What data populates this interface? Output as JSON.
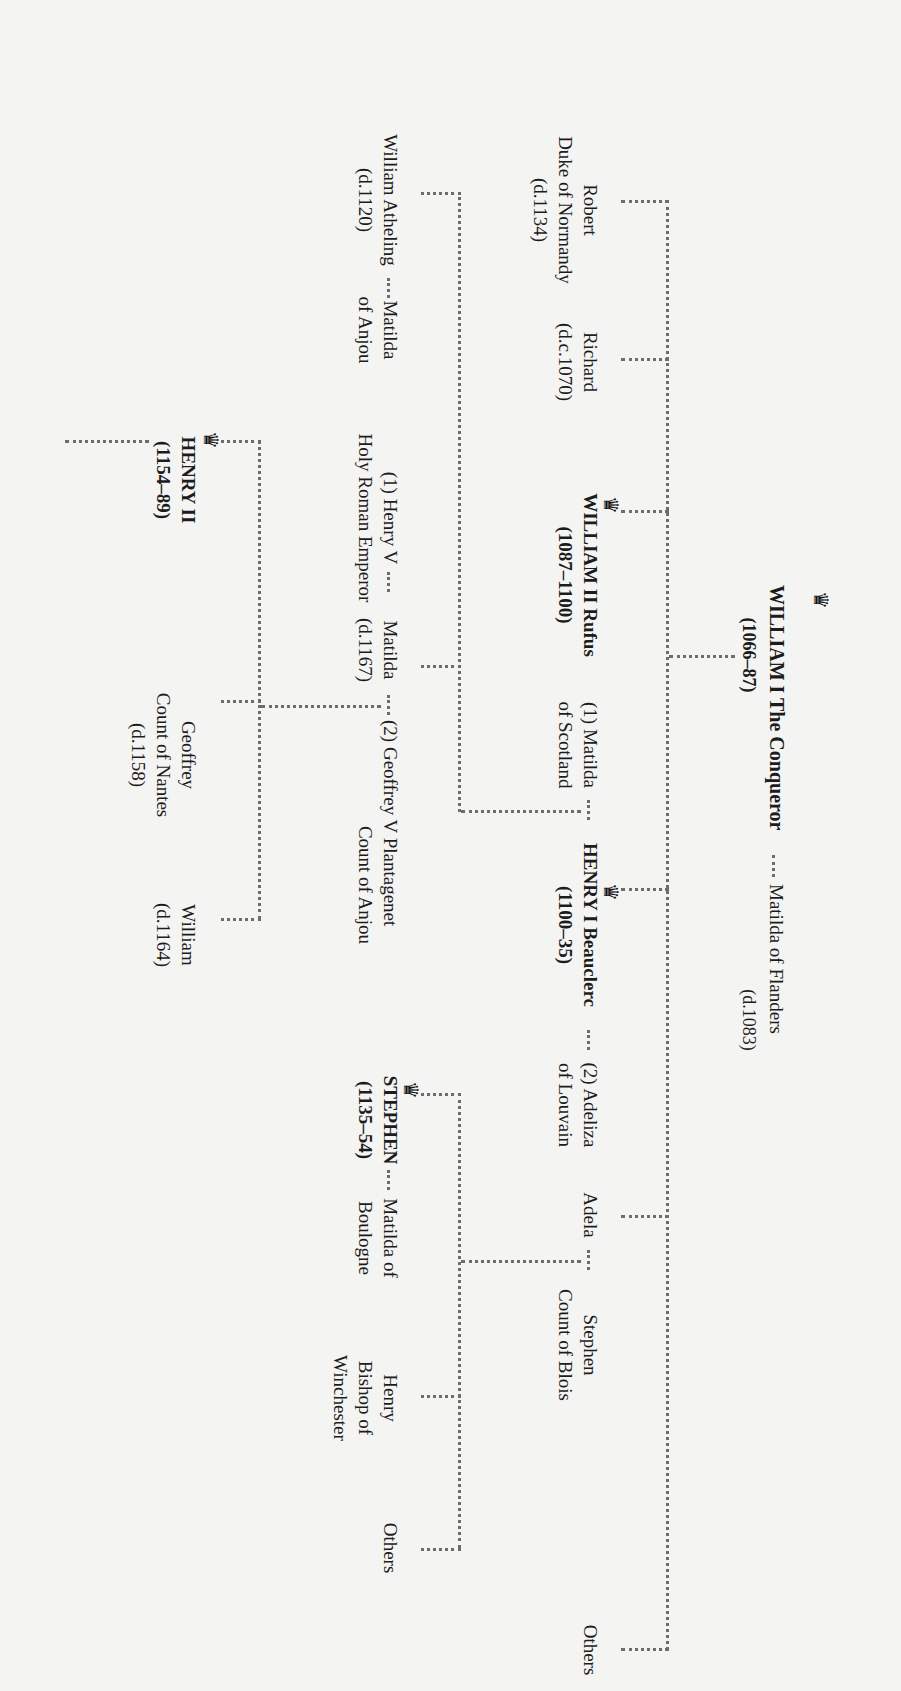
{
  "orientation": "rotated 90 degrees clockwise",
  "colors": {
    "line": "#6d6d6d",
    "text": "#1c1c1c",
    "background": "#f4f4f3"
  },
  "generation_1": {
    "william_i": {
      "name": "WILLIAM I The Conqueror",
      "dates": "(1066–87)",
      "crowned": true
    },
    "matilda_flanders": {
      "name": "Matilda of Flanders",
      "dates": "(d.1083)"
    }
  },
  "generation_2": {
    "robert": {
      "name": "Robert",
      "line2": "Duke of Normandy",
      "dates": "(d.1134)"
    },
    "richard": {
      "name": "Richard",
      "dates": "(d.c.1070)"
    },
    "william_ii": {
      "name": "WILLIAM II Rufus",
      "dates": "(1087–1100)",
      "crowned": true
    },
    "matilda_scotland": {
      "name": "(1) Matilda",
      "line2": "of Scotland"
    },
    "henry_i": {
      "name": "HENRY I Beauclerc",
      "dates": "(1100–35)",
      "crowned": true
    },
    "adeliza": {
      "name": "(2) Adeliza",
      "line2": "of Louvain"
    },
    "adela": {
      "name": "Adela"
    },
    "stephen_blois": {
      "name": "Stephen",
      "line2": "Count of Blois"
    },
    "others": {
      "name": "Others"
    }
  },
  "generation_3": {
    "william_atheling": {
      "name": "William Atheling",
      "dates": "(d.1120)"
    },
    "matilda_anjou": {
      "name": "Matilda",
      "line2": "of Anjou"
    },
    "henry_v": {
      "name": "(1) Henry V",
      "line2": "Holy Roman Emperor"
    },
    "matilda": {
      "name": "Matilda",
      "dates": "(d.1167)"
    },
    "geoffrey_v": {
      "name": "(2) Geoffrey V Plantagenet",
      "line2": "Count of Anjou"
    },
    "stephen": {
      "name": "STEPHEN",
      "dates": "(1135–54)",
      "crowned": true
    },
    "matilda_boulogne": {
      "name": "Matilda of",
      "line2": "Boulogne"
    },
    "henry_winchester": {
      "name": "Henry",
      "line2": "Bishop of",
      "line3": "Winchester"
    },
    "others": {
      "name": "Others"
    }
  },
  "generation_4": {
    "henry_ii": {
      "name": "HENRY II",
      "dates": "(1154–89)",
      "crowned": true
    },
    "geoffrey_nantes": {
      "name": "Geoffrey",
      "line2": "Count of Nantes",
      "dates": "(d.1158)"
    },
    "william": {
      "name": "William",
      "dates": "(d.1164)"
    }
  },
  "icons": {
    "crown": "♛"
  }
}
